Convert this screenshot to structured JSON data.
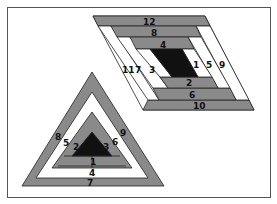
{
  "diagram": {
    "colors": {
      "gray": "#8a8a8a",
      "black": "#111111",
      "white": "#ffffff",
      "outline": "#222222"
    },
    "parallelogram": {
      "labels": {
        "center_right": "1",
        "bottom_2": "2",
        "left_3": "3",
        "top_4": "4",
        "right_5": "5",
        "bottom_6": "6",
        "left_7": "7",
        "top_8": "8",
        "right_9": "9",
        "bottom_10": "10",
        "left_11": "11",
        "top_12": "12"
      }
    },
    "triangle": {
      "labels": {
        "center_1": "1",
        "left_2": "2",
        "right_3": "3",
        "bottom_4": "4",
        "left_5": "5",
        "right_6": "6",
        "bottom_7": "7",
        "left_8": "8",
        "right_9": "9"
      }
    }
  }
}
